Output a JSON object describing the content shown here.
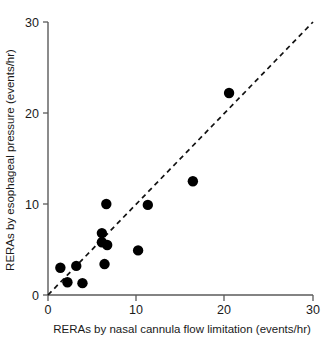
{
  "chart_data": {
    "type": "scatter",
    "title": "",
    "subtitle": "",
    "xlabel": "RERAs by nasal cannula flow limitation (events/hr)",
    "ylabel": "RERAs by esophageal pressure (events/hr)",
    "xlim": [
      0,
      30
    ],
    "ylim": [
      0,
      30
    ],
    "xticks": [
      0,
      10,
      20,
      30
    ],
    "yticks": [
      0,
      10,
      20,
      30
    ],
    "xtick_labels": [
      "0",
      "10",
      "20",
      "30"
    ],
    "ytick_labels": [
      "0",
      "10",
      "20",
      "30"
    ],
    "grid": false,
    "legend": null,
    "marker": "filled-circle",
    "marker_color": "#000000",
    "annotations": [
      {
        "name": "identity-line",
        "kind": "reference-line",
        "style": "dashed",
        "color": "#111111",
        "from": [
          0,
          0
        ],
        "to": [
          30,
          30
        ]
      }
    ],
    "series": [
      {
        "name": "RERA agreement",
        "points": [
          {
            "x": 1.4,
            "y": 3.0
          },
          {
            "x": 2.2,
            "y": 1.4
          },
          {
            "x": 3.2,
            "y": 3.2
          },
          {
            "x": 3.9,
            "y": 1.3
          },
          {
            "x": 6.1,
            "y": 6.8
          },
          {
            "x": 6.1,
            "y": 5.8
          },
          {
            "x": 6.7,
            "y": 5.5
          },
          {
            "x": 6.4,
            "y": 3.4
          },
          {
            "x": 6.6,
            "y": 10.0
          },
          {
            "x": 10.2,
            "y": 4.9
          },
          {
            "x": 11.3,
            "y": 9.9
          },
          {
            "x": 16.4,
            "y": 12.5
          },
          {
            "x": 20.5,
            "y": 22.2
          }
        ]
      }
    ]
  },
  "axes": {
    "x_title": "RERAs by nasal cannula flow limitation (events/hr)",
    "y_title": "RERAs by esophageal pressure (events/hr)",
    "x_tick_0": "0",
    "x_tick_1": "10",
    "x_tick_2": "20",
    "x_tick_3": "30",
    "y_tick_0": "0",
    "y_tick_1": "10",
    "y_tick_2": "20",
    "y_tick_3": "30"
  },
  "colors": {
    "marker": "#000000",
    "axis": "#5a5a5a",
    "reference_line": "#111111",
    "background": "#ffffff"
  }
}
